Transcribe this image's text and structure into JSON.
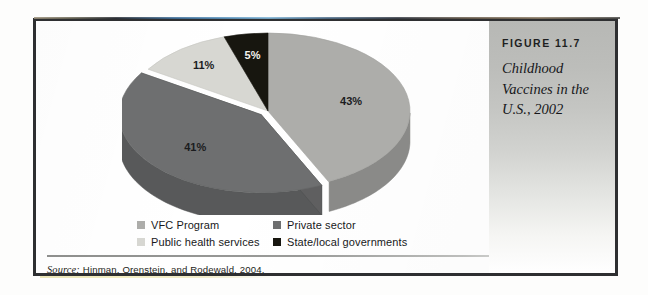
{
  "figure": {
    "number": "FIGURE 11.7",
    "title": "Childhood Vaccines in the U.S., 2002"
  },
  "source": {
    "label": "Source:",
    "text": "Hinman, Orenstein, and Rodewald, 2004."
  },
  "legend": {
    "items": [
      {
        "label": "VFC Program",
        "color": "#adadaa"
      },
      {
        "label": "Private sector",
        "color": "#6e6f70"
      },
      {
        "label": "Public health services",
        "color": "#d7d7d2"
      },
      {
        "label": "State/local governments",
        "color": "#17160f"
      }
    ]
  },
  "chart_data": {
    "type": "pie",
    "title": "Childhood Vaccines in the U.S., 2002",
    "subtitle": "",
    "xlabel": "",
    "ylabel": "",
    "grid": false,
    "legend_position": "bottom",
    "three_d": true,
    "exploded_slice": "Private sector",
    "start_angle_deg": 0,
    "direction": "clockwise",
    "total": 100,
    "units": "percent",
    "labels": [
      "VFC Program",
      "Private sector",
      "Public health services",
      "State/local governments"
    ],
    "values": [
      43,
      41,
      11,
      5
    ],
    "value_labels": [
      "43%",
      "41%",
      "11%",
      "5%"
    ],
    "colors": [
      "#adadaa",
      "#6e6f70",
      "#d7d7d2",
      "#17160f"
    ],
    "slices": [
      {
        "label": "VFC Program",
        "value": 43,
        "value_label": "43%",
        "color": "#adadaa"
      },
      {
        "label": "Private sector",
        "value": 41,
        "value_label": "41%",
        "color": "#6e6f70"
      },
      {
        "label": "Public health services",
        "value": 11,
        "value_label": "11%",
        "color": "#d7d7d2"
      },
      {
        "label": "State/local governments",
        "value": 5,
        "value_label": "5%",
        "color": "#17160f"
      }
    ]
  }
}
